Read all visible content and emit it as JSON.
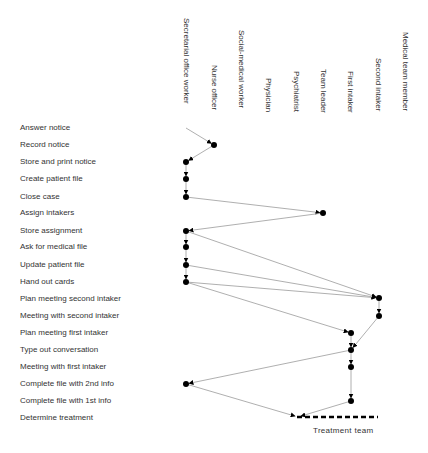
{
  "columns": [
    {
      "label": "Secretarial office worker",
      "x": 186,
      "top": 18
    },
    {
      "label": "Nurse officer",
      "x": 214,
      "top": 65
    },
    {
      "label": "Social-medical worker",
      "x": 241,
      "top": 30
    },
    {
      "label": "Physician",
      "x": 268,
      "top": 78
    },
    {
      "label": "Psychiatrist",
      "x": 296,
      "top": 71
    },
    {
      "label": "Team leader",
      "x": 323,
      "top": 69
    },
    {
      "label": "First intaker",
      "x": 350,
      "top": 71
    },
    {
      "label": "Second intaker",
      "x": 378,
      "top": 58
    },
    {
      "label": "Medical team member",
      "x": 405,
      "top": 32
    }
  ],
  "rows": [
    {
      "label": "Answer notice",
      "y": 128
    },
    {
      "label": "Record notice",
      "y": 145
    },
    {
      "label": "Store and print notice",
      "y": 162
    },
    {
      "label": "Create patient file",
      "y": 179
    },
    {
      "label": "Close case",
      "y": 197
    },
    {
      "label": "Assign intakers",
      "y": 213
    },
    {
      "label": "Store assignment",
      "y": 231
    },
    {
      "label": "Ask for medical file",
      "y": 247
    },
    {
      "label": "Update patient file",
      "y": 265
    },
    {
      "label": "Hand out cards",
      "y": 282
    },
    {
      "label": "Plan meeting second intaker",
      "y": 299
    },
    {
      "label": "Meeting with second intaker",
      "y": 316
    },
    {
      "label": "Plan meeting first intaker",
      "y": 333
    },
    {
      "label": "Type out conversation",
      "y": 350
    },
    {
      "label": "Meeting with first intaker",
      "y": 367
    },
    {
      "label": "Complete file with 2nd info",
      "y": 384
    },
    {
      "label": "Complete file with 1st info",
      "y": 401
    },
    {
      "label": "Determine treatment",
      "y": 418
    }
  ],
  "nodes": [
    {
      "row": "Record notice",
      "actor": "Nurse officer",
      "x": 214,
      "y": 145
    },
    {
      "row": "Store and print notice",
      "actor": "Secretarial office worker",
      "x": 186,
      "y": 162
    },
    {
      "row": "Create patient file",
      "actor": "Secretarial office worker",
      "x": 186,
      "y": 179
    },
    {
      "row": "Close case",
      "actor": "Secretarial office worker",
      "x": 186,
      "y": 197
    },
    {
      "row": "Assign intakers",
      "actor": "Team leader",
      "x": 323,
      "y": 213
    },
    {
      "row": "Store assignment",
      "actor": "Secretarial office worker",
      "x": 186,
      "y": 231
    },
    {
      "row": "Ask for medical file",
      "actor": "Secretarial office worker",
      "x": 186,
      "y": 247
    },
    {
      "row": "Update patient file",
      "actor": "Secretarial office worker",
      "x": 186,
      "y": 265
    },
    {
      "row": "Hand out cards",
      "actor": "Secretarial office worker",
      "x": 186,
      "y": 282
    },
    {
      "row": "Plan meeting second intaker",
      "actor": "Second intaker",
      "x": 379,
      "y": 298
    },
    {
      "row": "Meeting with second intaker",
      "actor": "Second intaker",
      "x": 379,
      "y": 316
    },
    {
      "row": "Plan meeting first intaker",
      "actor": "First intaker",
      "x": 351,
      "y": 333
    },
    {
      "row": "Type out conversation",
      "actor": "First intaker",
      "x": 351,
      "y": 350
    },
    {
      "row": "Meeting with first intaker",
      "actor": "First intaker",
      "x": 351,
      "y": 367
    },
    {
      "row": "Complete file with 2nd info",
      "actor": "Secretarial office worker",
      "x": 186,
      "y": 384
    },
    {
      "row": "Complete file with 1st info",
      "actor": "First intaker",
      "x": 351,
      "y": 401
    }
  ],
  "edges": [
    {
      "x1": 186,
      "y1": 128,
      "x2": 214,
      "y2": 145
    },
    {
      "x1": 214,
      "y1": 145,
      "x2": 186,
      "y2": 162
    },
    {
      "x1": 186,
      "y1": 162,
      "x2": 186,
      "y2": 179
    },
    {
      "x1": 186,
      "y1": 179,
      "x2": 186,
      "y2": 197
    },
    {
      "x1": 186,
      "y1": 197,
      "x2": 323,
      "y2": 213
    },
    {
      "x1": 323,
      "y1": 213,
      "x2": 186,
      "y2": 231
    },
    {
      "x1": 186,
      "y1": 231,
      "x2": 186,
      "y2": 247
    },
    {
      "x1": 186,
      "y1": 247,
      "x2": 186,
      "y2": 265
    },
    {
      "x1": 186,
      "y1": 265,
      "x2": 186,
      "y2": 282
    },
    {
      "x1": 186,
      "y1": 231,
      "x2": 379,
      "y2": 298
    },
    {
      "x1": 186,
      "y1": 265,
      "x2": 379,
      "y2": 298
    },
    {
      "x1": 186,
      "y1": 282,
      "x2": 379,
      "y2": 298
    },
    {
      "x1": 186,
      "y1": 282,
      "x2": 351,
      "y2": 333
    },
    {
      "x1": 379,
      "y1": 298,
      "x2": 379,
      "y2": 316
    },
    {
      "x1": 379,
      "y1": 316,
      "x2": 351,
      "y2": 350
    },
    {
      "x1": 351,
      "y1": 333,
      "x2": 351,
      "y2": 350
    },
    {
      "x1": 351,
      "y1": 350,
      "x2": 351,
      "y2": 367
    },
    {
      "x1": 351,
      "y1": 367,
      "x2": 351,
      "y2": 401
    },
    {
      "x1": 351,
      "y1": 350,
      "x2": 186,
      "y2": 384
    },
    {
      "x1": 186,
      "y1": 384,
      "x2": 298,
      "y2": 417
    },
    {
      "x1": 351,
      "y1": 401,
      "x2": 298,
      "y2": 417
    }
  ],
  "treatment_team": {
    "label": "Treatment team",
    "x1": 297,
    "x2": 378,
    "y": 417,
    "label_x": 313,
    "label_y": 426
  },
  "colors": {
    "text": "#333333",
    "edge": "#9a9a9a",
    "node": "#000000"
  }
}
